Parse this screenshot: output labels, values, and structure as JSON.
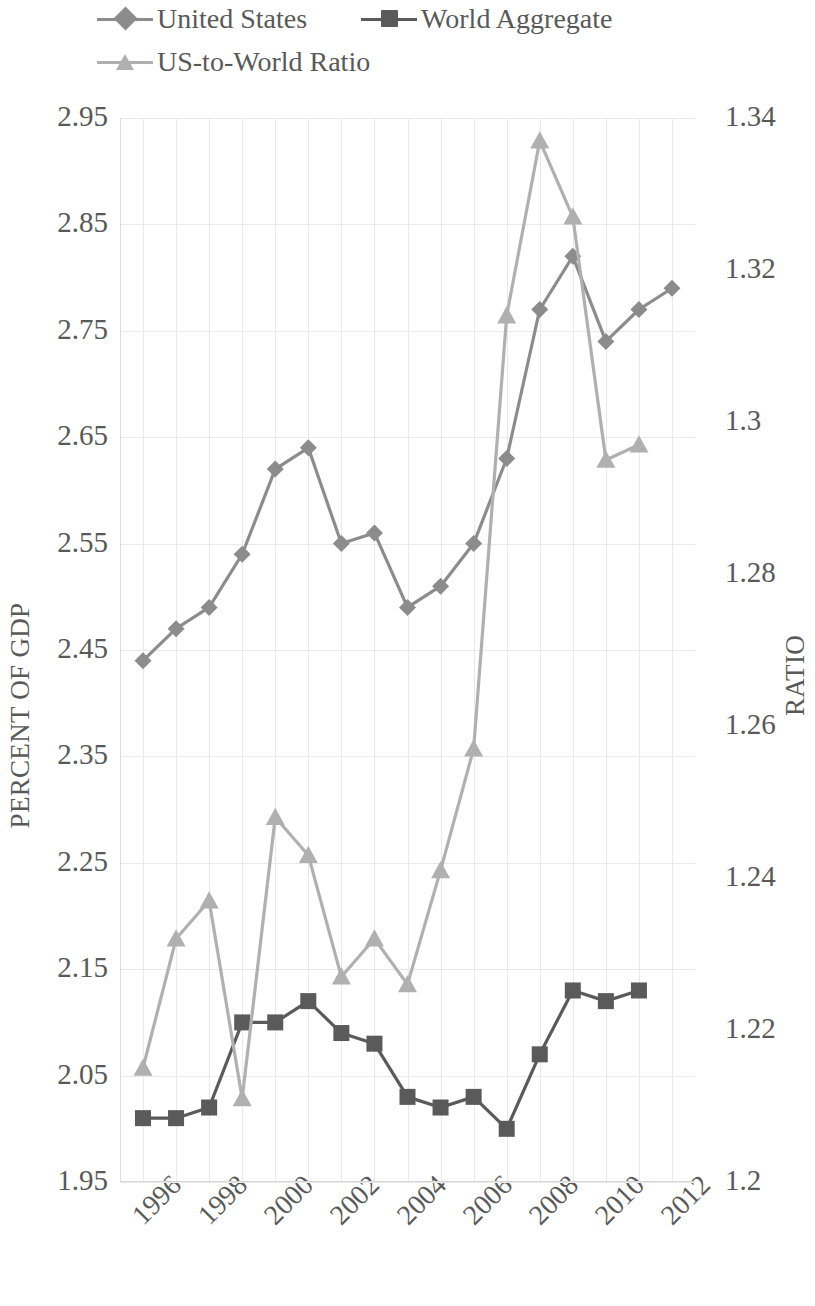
{
  "legend": {
    "items": [
      {
        "label": "United States",
        "marker": "diamond-marker-icon",
        "color": "#8c8c8c"
      },
      {
        "label": "World Aggregate",
        "marker": "square-marker-icon",
        "color": "#5a5a5a"
      },
      {
        "label": "US-to-World Ratio",
        "marker": "triangle-marker-icon",
        "color": "#b0b0b0"
      }
    ]
  },
  "axes": {
    "left": {
      "title": "PERCENT OF GDP",
      "ticks": [
        "2.95",
        "2.85",
        "2.75",
        "2.65",
        "2.55",
        "2.45",
        "2.35",
        "2.25",
        "2.15",
        "2.05",
        "1.95"
      ],
      "min": 1.95,
      "max": 2.95,
      "step": 0.1
    },
    "right": {
      "title": "RATIO",
      "ticks": [
        "1.34",
        "1.32",
        "1.3",
        "1.28",
        "1.26",
        "1.24",
        "1.22",
        "1.2"
      ],
      "min": 1.2,
      "max": 1.34,
      "step": 0.02
    },
    "bottom": {
      "ticks": [
        "1996",
        "1998",
        "2000",
        "2002",
        "2004",
        "2006",
        "2008",
        "2010",
        "2012"
      ]
    }
  },
  "chart_data": {
    "type": "line",
    "title": "",
    "xlabel": "",
    "ylabel": "PERCENT OF GDP",
    "y2label": "RATIO",
    "ylim": [
      1.95,
      2.95
    ],
    "y2lim": [
      1.2,
      1.34
    ],
    "grid": true,
    "legend_position": "top",
    "x": [
      1996,
      1997,
      1998,
      1999,
      2000,
      2001,
      2002,
      2003,
      2004,
      2005,
      2006,
      2007,
      2008,
      2009,
      2010,
      2011,
      2012
    ],
    "series": [
      {
        "name": "United States",
        "axis": "left",
        "marker": "diamond",
        "color": "#8c8c8c",
        "x": [
          1996,
          1997,
          1998,
          1999,
          2000,
          2001,
          2002,
          2003,
          2004,
          2005,
          2006,
          2007,
          2008,
          2009,
          2010,
          2011,
          2012
        ],
        "values": [
          2.44,
          2.47,
          2.49,
          2.54,
          2.62,
          2.64,
          2.55,
          2.56,
          2.49,
          2.51,
          2.55,
          2.63,
          2.77,
          2.82,
          2.74,
          2.77,
          2.79
        ]
      },
      {
        "name": "World Aggregate",
        "axis": "left",
        "marker": "square",
        "color": "#5a5a5a",
        "x": [
          1996,
          1997,
          1998,
          1999,
          2000,
          2001,
          2002,
          2003,
          2004,
          2005,
          2006,
          2007,
          2008,
          2009,
          2010,
          2011
        ],
        "values": [
          2.01,
          2.01,
          2.02,
          2.1,
          2.1,
          2.12,
          2.09,
          2.08,
          2.03,
          2.02,
          2.03,
          2.0,
          2.07,
          2.13,
          2.12,
          2.13
        ]
      },
      {
        "name": "US-to-World Ratio",
        "axis": "right",
        "marker": "triangle",
        "color": "#b0b0b0",
        "x": [
          1996,
          1997,
          1998,
          1999,
          2000,
          2001,
          2002,
          2003,
          2004,
          2005,
          2006,
          2007,
          2008,
          2009,
          2010,
          2011
        ],
        "values": [
          1.215,
          1.232,
          1.237,
          1.211,
          1.248,
          1.243,
          1.227,
          1.232,
          1.226,
          1.241,
          1.257,
          1.314,
          1.337,
          1.327,
          1.295,
          1.297
        ]
      }
    ]
  },
  "colors": {
    "us": "#8c8c8c",
    "world": "#5a5a5a",
    "ratio": "#b0b0b0",
    "grid": "#e9e9e9",
    "text": "#595959"
  }
}
